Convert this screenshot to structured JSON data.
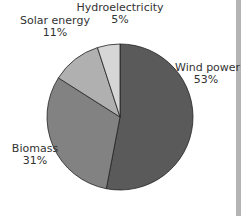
{
  "chart_data": {
    "type": "pie",
    "title": "",
    "categories": [
      "Wind power",
      "Biomass",
      "Solar energy",
      "Hydroelectricity"
    ],
    "values": [
      53,
      31,
      11,
      5
    ],
    "labels": [
      "Wind power\n53%",
      "Biomass\n31%",
      "Solar energy\n11%",
      "Hydroelectricity\n5%"
    ],
    "colors": [
      "#5a5a5a",
      "#828282",
      "#b0b0b0",
      "#d6d6d6"
    ],
    "start_angle": "12 o'clock, clockwise"
  },
  "labels": {
    "wind": {
      "name": "Wind power",
      "pct": "53%"
    },
    "biomass": {
      "name": "Biomass",
      "pct": "31%"
    },
    "solar": {
      "name": "Solar energy",
      "pct": "11%"
    },
    "hydro": {
      "name": "Hydroelectricity",
      "pct": "5%"
    }
  }
}
